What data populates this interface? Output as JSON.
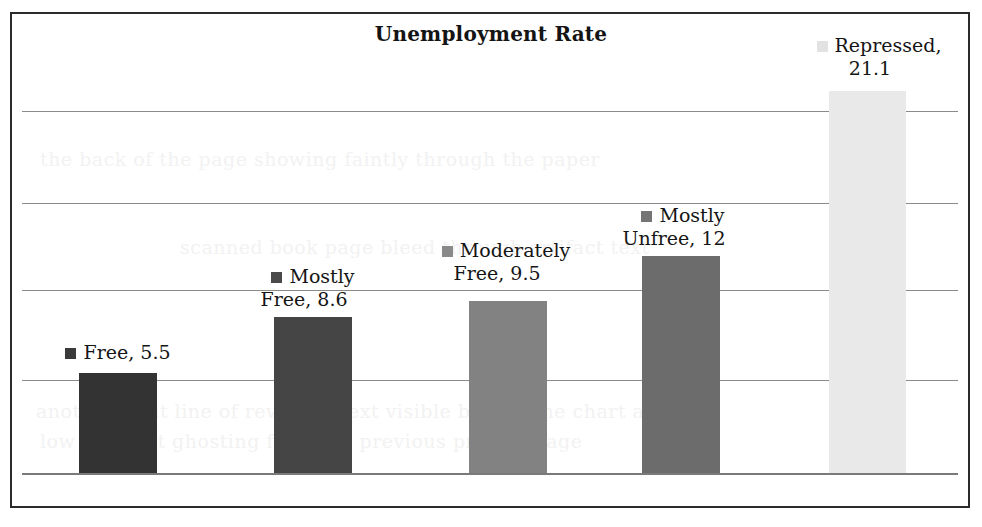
{
  "chart_data": {
    "type": "bar",
    "title": "Unemployment Rate",
    "xlabel": "",
    "ylabel": "",
    "grid": true,
    "legend_position": "data-labels",
    "categories": [
      "Free",
      "Mostly Free",
      "Moderately Free",
      "Mostly Unfree",
      "Repressed"
    ],
    "values": [
      5.5,
      8.6,
      9.5,
      12,
      21.1
    ],
    "ylim": [
      0,
      25
    ],
    "gridline_values": [
      5,
      10,
      15,
      20
    ],
    "bars": [
      {
        "label_line1": "Free, 5.5",
        "label_line2": "",
        "category": "Free",
        "value": 5.5,
        "value_text": "5.5",
        "color": "#333333",
        "marker_color": "#3a3a3a"
      },
      {
        "label_line1": "Mostly",
        "label_line2": "Free, 8.6",
        "category": "Mostly Free",
        "value": 8.6,
        "value_text": "8.6",
        "color": "#454545",
        "marker_color": "#4a4a4a"
      },
      {
        "label_line1": "Moderately",
        "label_line2": "Free, 9.5",
        "category": "Moderately Free",
        "value": 9.5,
        "value_text": "9.5",
        "color": "#828282",
        "marker_color": "#8a8a8a"
      },
      {
        "label_line1": "Mostly",
        "label_line2": "Unfree, 12",
        "category": "Mostly Unfree",
        "value": 12,
        "value_text": "12",
        "color": "#6c6c6c",
        "marker_color": "#747474"
      },
      {
        "label_line1": "Repressed,",
        "label_line2": "21.1",
        "category": "Repressed",
        "value": 21.1,
        "value_text": "21.1",
        "color": "#e9e9e9",
        "marker_color": "#e2e2e2"
      }
    ]
  },
  "colors": {
    "frame_border": "#2b2b2b",
    "gridline": "#8a8a8a",
    "axis": "#7a7a7a",
    "text": "#151515",
    "background": "#ffffff"
  },
  "ghost_text": {
    "line1": "the back of the page showing faintly through the paper",
    "line2": "scanned book page bleed through artifact text",
    "line3": "another faint line of reversed text visible behind the chart area",
    "line4": "low contrast ghosting from the previous printed page"
  }
}
